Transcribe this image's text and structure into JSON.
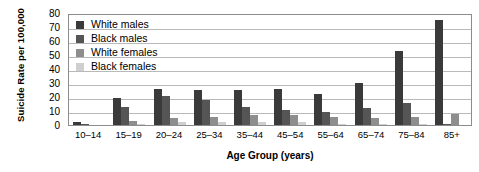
{
  "chart_data": {
    "type": "bar",
    "title": "",
    "xlabel": "Age Group (years)",
    "ylabel": "Suicide Rate per 100,000",
    "ylim": [
      0,
      80
    ],
    "yticks": [
      80,
      70,
      60,
      50,
      40,
      30,
      20,
      10,
      0
    ],
    "grid": true,
    "legend_position": "top-left-inside",
    "categories": [
      "10–14",
      "15–19",
      "20–24",
      "25–34",
      "35–44",
      "45–54",
      "55–64",
      "65–74",
      "75–84",
      "85+"
    ],
    "series": [
      {
        "name": "White males",
        "color": "#3a3a3a",
        "values": [
          2,
          19,
          26,
          25,
          25,
          26,
          22,
          30,
          53,
          75
        ]
      },
      {
        "name": "Black males",
        "color": "#555555",
        "values": [
          1,
          13,
          21,
          18,
          13,
          11,
          9,
          12,
          16,
          1
        ]
      },
      {
        "name": "White females",
        "color": "#8e8e8e",
        "values": [
          0,
          3,
          5,
          6,
          7,
          7,
          6,
          5,
          6,
          8
        ]
      },
      {
        "name": "Black females",
        "color": "#cfcfcf",
        "values": [
          0,
          1,
          2,
          2,
          2,
          2,
          1,
          1,
          1,
          0
        ]
      }
    ]
  },
  "axis": {
    "y_title": "Suicide Rate per 100,000",
    "x_title": "Age Group (years)"
  }
}
